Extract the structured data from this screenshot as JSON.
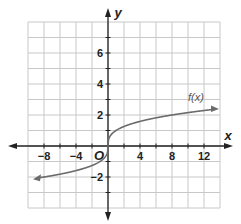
{
  "chart_data": {
    "type": "line",
    "title": "",
    "xlabel": "x",
    "ylabel": "y",
    "origin_label": "O",
    "xlim": [
      -10,
      14
    ],
    "ylim": [
      -4,
      8
    ],
    "x_grid_step": 2,
    "y_grid_step": 1,
    "grid": true,
    "x_ticks": [
      -8,
      -4,
      4,
      8,
      12
    ],
    "x_tick_labels": [
      "−8",
      "−4",
      "4",
      "8",
      "12"
    ],
    "y_ticks": [
      -2,
      2,
      4,
      6
    ],
    "y_tick_labels": [
      "−2",
      "2",
      "4",
      "6"
    ],
    "series": [
      {
        "name": "f(x)",
        "function": "cube root of x",
        "x": [
          -9,
          -8,
          -1,
          0,
          1,
          8,
          13.5
        ],
        "values": [
          -2.08,
          -2,
          -1,
          0,
          1,
          2,
          2.38
        ],
        "color": "#6b6b6b",
        "arrows": "both"
      }
    ],
    "annotations": [
      {
        "text": "f(x)",
        "x": 11,
        "y": 2.9
      }
    ]
  }
}
